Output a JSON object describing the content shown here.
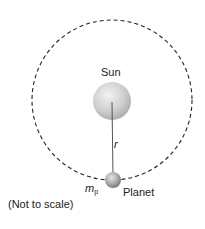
{
  "diagram": {
    "sun": {
      "label": "Sun",
      "color": "#c8c8c8"
    },
    "planet": {
      "label": "Planet",
      "mass_symbol": "m",
      "mass_subscript": "p",
      "color": "#9a9a9a"
    },
    "radius": {
      "label": "r"
    },
    "orbit": {
      "style": "dashed",
      "color": "#222222"
    },
    "note": "(Not to scale)"
  }
}
